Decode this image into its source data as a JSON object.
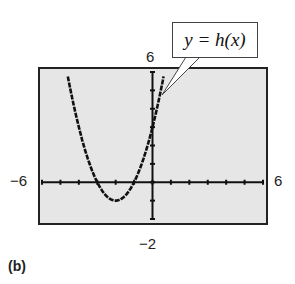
{
  "chart_data": {
    "type": "line",
    "title": "",
    "panel_label": "(b)",
    "function_label": "y = h(x)",
    "function": "h(x) = x^2 + 4x + 3",
    "xlabel": "",
    "ylabel": "",
    "xlim": [
      -6,
      6
    ],
    "ylim": [
      -2,
      6
    ],
    "xscale": 1,
    "yscale": 1,
    "grid": false,
    "tick_labels": {
      "xmin": "−6",
      "xmax": "6",
      "ymin": "−2",
      "ymax": "6"
    },
    "series": [
      {
        "name": "y = h(x)",
        "x": [
          -4.6,
          -4.5,
          -4,
          -3.5,
          -3,
          -2.5,
          -2,
          -1.5,
          -1,
          -0.5,
          0,
          0.5,
          0.6
        ],
        "values": [
          5.76,
          5.25,
          3,
          1.25,
          0,
          -0.75,
          -1,
          -0.75,
          0,
          1.25,
          3,
          5.25,
          5.76
        ]
      }
    ],
    "key_points": {
      "vertex": [
        -2,
        -1
      ],
      "x_intercepts": [
        -3,
        -1
      ],
      "y_intercept": 3
    }
  },
  "labels": {
    "xmin": "−6",
    "xmax": "6",
    "ymin": "−2",
    "ymax": "6",
    "callout": "y = h(x)",
    "panel": "(b)"
  }
}
